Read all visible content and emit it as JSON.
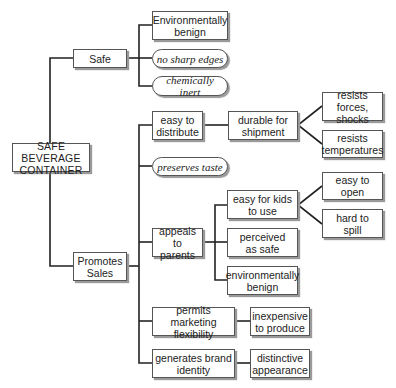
{
  "diagram": {
    "type": "tree",
    "orientation": "left-to-right",
    "root": "SAFE BEVERAGE\nCONTAINER",
    "nodes": {
      "root": {
        "label": "SAFE BEVERAGE\nCONTAINER",
        "style": "box"
      },
      "safe": {
        "label": "Safe",
        "style": "box"
      },
      "promotes": {
        "label": "Promotes\nSales",
        "style": "box"
      },
      "env_benign_1": {
        "label": "Environmentally\nbenign",
        "style": "box"
      },
      "no_sharp": {
        "label": "no sharp edges",
        "style": "pill"
      },
      "chem_inert": {
        "label": "chemically inert",
        "style": "pill"
      },
      "easy_distribute": {
        "label": "easy to\ndistribute",
        "style": "box"
      },
      "durable": {
        "label": "durable for\nshipment",
        "style": "box"
      },
      "resists_forces": {
        "label": "resists forces,\nshocks",
        "style": "box"
      },
      "resists_temp": {
        "label": "resists\ntemperatures",
        "style": "box"
      },
      "preserves": {
        "label": "preserves taste",
        "style": "pill"
      },
      "appeals": {
        "label": "appeals to\nparents",
        "style": "box"
      },
      "easy_kids": {
        "label": "easy for kids\nto use",
        "style": "box"
      },
      "easy_open": {
        "label": "easy to\nopen",
        "style": "box"
      },
      "hard_spill": {
        "label": "hard to\nspill",
        "style": "box"
      },
      "perceived_safe": {
        "label": "perceived\nas safe",
        "style": "box"
      },
      "env_benign_2": {
        "label": "environmentally\nbenign",
        "style": "box"
      },
      "marketing": {
        "label": "permits marketing\nflexibility",
        "style": "box"
      },
      "inexpensive": {
        "label": "inexpensive\nto produce",
        "style": "box"
      },
      "brand": {
        "label": "generates brand\nidentity",
        "style": "box"
      },
      "distinctive": {
        "label": "distinctive\nappearance",
        "style": "box"
      }
    },
    "edges": [
      [
        "root",
        "safe"
      ],
      [
        "root",
        "promotes"
      ],
      [
        "safe",
        "env_benign_1"
      ],
      [
        "safe",
        "no_sharp"
      ],
      [
        "safe",
        "chem_inert"
      ],
      [
        "promotes",
        "easy_distribute"
      ],
      [
        "promotes",
        "preserves"
      ],
      [
        "promotes",
        "appeals"
      ],
      [
        "promotes",
        "marketing"
      ],
      [
        "promotes",
        "brand"
      ],
      [
        "easy_distribute",
        "durable"
      ],
      [
        "durable",
        "resists_forces"
      ],
      [
        "durable",
        "resists_temp"
      ],
      [
        "appeals",
        "easy_kids"
      ],
      [
        "appeals",
        "perceived_safe"
      ],
      [
        "appeals",
        "env_benign_2"
      ],
      [
        "easy_kids",
        "easy_open"
      ],
      [
        "easy_kids",
        "hard_spill"
      ],
      [
        "marketing",
        "inexpensive"
      ],
      [
        "brand",
        "distinctive"
      ]
    ],
    "colors": {
      "line": "#222222",
      "box_border": "#555555",
      "shadow": "#9a9a9a",
      "background": "#ffffff"
    }
  }
}
